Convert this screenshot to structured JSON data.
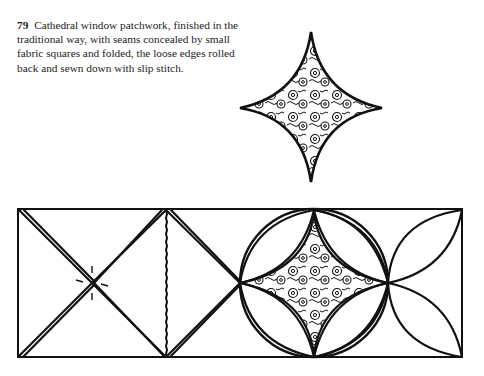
{
  "figure": {
    "number": "79",
    "caption": "Cathedral window patchwork, finished in the traditional way, with seams concealed by small fabric squares and folded, the loose edges rolled back and sewn down with slip stitch."
  },
  "illustrations": {
    "detail_diamond": {
      "label": "patterned fabric square (detail)"
    },
    "strip": {
      "label": "cathedral window patchwork construction stages"
    }
  },
  "colors": {
    "ink": "#111111",
    "paper": "#ffffff"
  }
}
